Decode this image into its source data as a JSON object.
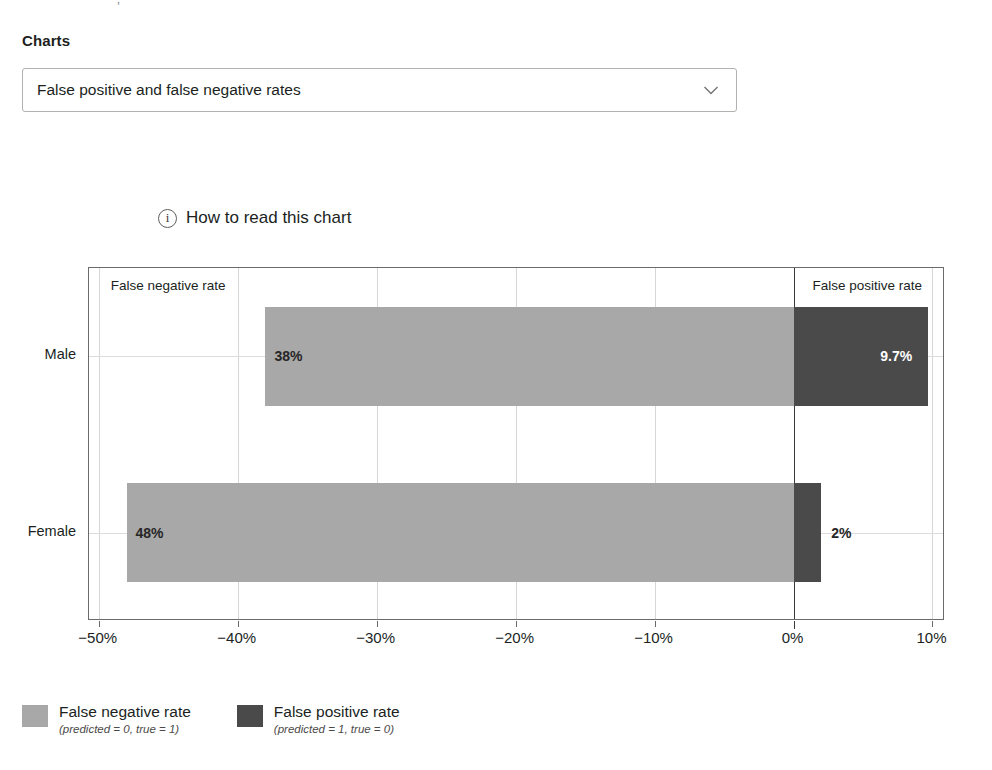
{
  "top_remnant": ". ' ",
  "section": {
    "label": "Charts"
  },
  "chart_selector": {
    "selected": "False positive and false negative rates",
    "chevron_icon": "chevron-down-icon"
  },
  "how_to_read": {
    "icon": "info-icon",
    "label": "How to read this chart"
  },
  "legend": [
    {
      "title": "False negative rate",
      "subtitle": "(predicted = 0, true = 1)",
      "color": "#a8a8a8",
      "swatch_icon": "legend-swatch-false-negative"
    },
    {
      "title": "False positive rate",
      "subtitle": "(predicted = 1, true = 0)",
      "color": "#4a4a4a",
      "swatch_icon": "legend-swatch-false-positive"
    }
  ],
  "chart_data": {
    "type": "bar",
    "orientation": "horizontal",
    "stacked": "diverging",
    "title": "",
    "xlabel": "",
    "ylabel": "",
    "categories": [
      "Male",
      "Female"
    ],
    "xticks": [
      -50,
      -40,
      -30,
      -20,
      -10,
      0,
      10
    ],
    "xticklabels": [
      "−50%",
      "−40%",
      "−30%",
      "−20%",
      "−10%",
      "0%",
      "10%"
    ],
    "xlim": [
      -50.7,
      10.9
    ],
    "grid": true,
    "legend_position": "below",
    "zone_labels": [
      {
        "text": "False negative rate",
        "side": "left"
      },
      {
        "text": "False positive rate",
        "side": "right"
      }
    ],
    "series": [
      {
        "name": "False negative rate",
        "color": "#a8a8a8",
        "values": [
          -38,
          -48
        ],
        "value_labels": [
          "38%",
          "48%"
        ]
      },
      {
        "name": "False positive rate",
        "color": "#4a4a4a",
        "values": [
          9.7,
          2
        ],
        "value_labels": [
          "9.7%",
          "2%"
        ]
      }
    ]
  }
}
